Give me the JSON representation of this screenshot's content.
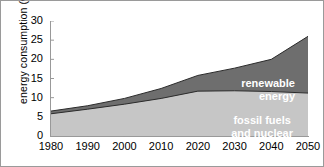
{
  "chart_data": {
    "type": "area",
    "title": "",
    "xlabel": "",
    "ylabel": "energy consumption (Gtoe)",
    "stacked": true,
    "grid": false,
    "legend_position": "inside-plot",
    "xlim": [
      1980,
      2050
    ],
    "ylim": [
      0,
      30
    ],
    "x": [
      1980,
      1990,
      2000,
      2010,
      2020,
      2030,
      2040,
      2050
    ],
    "xticks": [
      "1980",
      "1990",
      "2000",
      "2010",
      "2020",
      "2030",
      "2040",
      "2050"
    ],
    "yticks": [
      "0",
      "5",
      "10",
      "15",
      "20",
      "25",
      "30"
    ],
    "ytick_values": [
      0,
      5,
      10,
      15,
      20,
      25,
      30
    ],
    "series": [
      {
        "name": "fossil fuels and nuclear",
        "values": [
          5.8,
          7.0,
          8.3,
          9.8,
          11.7,
          11.8,
          11.6,
          11.2
        ],
        "color": "#c6c6c6"
      },
      {
        "name": "renewable energy",
        "values": [
          0.7,
          0.9,
          1.5,
          2.6,
          4.1,
          5.9,
          8.4,
          14.8
        ],
        "color": "#6e6e6e"
      }
    ],
    "totals": [
      6.5,
      7.9,
      9.8,
      12.4,
      15.8,
      17.7,
      20.0,
      26.0
    ],
    "annotations": [
      {
        "text": "renewable\nenergy",
        "series": "renewable energy",
        "color": "#ffffff"
      },
      {
        "text": "fossil fuels\nand nuclear",
        "series": "fossil fuels and nuclear",
        "color": "#ffffff"
      }
    ]
  },
  "axis": {
    "y_title": "energy consumption (Gtoe)",
    "y_ticks": [
      "30",
      "25",
      "20",
      "15",
      "10",
      "5",
      "0"
    ],
    "x_ticks": [
      "1980",
      "1990",
      "2000",
      "2010",
      "2020",
      "2030",
      "2040",
      "2050"
    ]
  },
  "labels": {
    "renewable": "renewable\nenergy",
    "fossil": "fossil fuels\nand nuclear"
  },
  "colors": {
    "fossil": "#c6c6c6",
    "renewable": "#6e6e6e",
    "axis": "#999999",
    "frame": "#9a9a9a",
    "text": "#000000",
    "label_text": "#ffffff"
  }
}
